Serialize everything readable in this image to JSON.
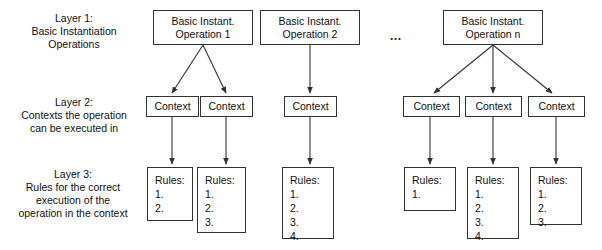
{
  "diagram": {
    "ellipsis": "...",
    "stroke_color": "#333333",
    "background_color": "#ffffff",
    "text_color": "#111111"
  },
  "layers": [
    {
      "id": "layer1",
      "label": "Layer 1:\nBasic Instantiation\nOperations"
    },
    {
      "id": "layer2",
      "label": "Layer 2:\nContexts the operation\ncan be executed in"
    },
    {
      "id": "layer3",
      "label": "Layer 3:\nRules for the correct\nexecution of the\noperation in the context"
    }
  ],
  "operations": [
    {
      "line1": "Basic Instant.",
      "line2": "Operation 1"
    },
    {
      "line1": "Basic Instant.",
      "line2": "Operation 2"
    },
    {
      "line1": "Basic Instant.",
      "line2": "Operation n"
    }
  ],
  "contexts": [
    {
      "label": "Context"
    },
    {
      "label": "Context"
    },
    {
      "label": "Context"
    },
    {
      "label": "Context"
    },
    {
      "label": "Context"
    },
    {
      "label": "Context"
    }
  ],
  "rules": [
    {
      "title": "Rules:",
      "items": [
        "1.",
        "2."
      ]
    },
    {
      "title": "Rules:",
      "items": [
        "1.",
        "2.",
        "3."
      ]
    },
    {
      "title": "Rules:",
      "items": [
        "1.",
        "2.",
        "3.",
        "4."
      ]
    },
    {
      "title": "Rules:",
      "items": [
        "1."
      ]
    },
    {
      "title": "Rules:",
      "items": [
        "1.",
        "2.",
        "3.",
        "4."
      ]
    },
    {
      "title": "Rules:",
      "items": [
        "1.",
        "2.",
        "3."
      ]
    }
  ]
}
